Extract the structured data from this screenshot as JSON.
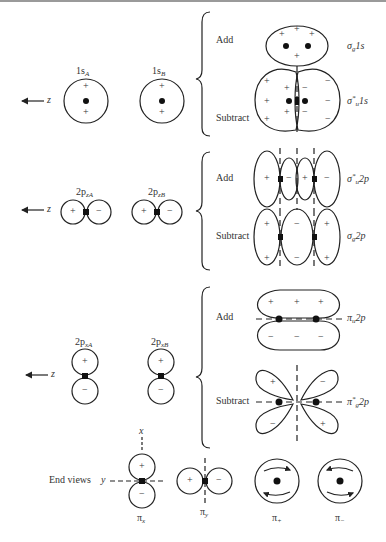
{
  "axis": {
    "z_label": "z",
    "x_label": "x",
    "y_label": "y"
  },
  "atomic_orbitals": {
    "s_A": {
      "main": "1s",
      "sub": "A"
    },
    "s_B": {
      "main": "1s",
      "sub": "B"
    },
    "pz_A": {
      "main": "2p",
      "sub": "zA"
    },
    "pz_B": {
      "main": "2p",
      "sub": "zB"
    },
    "px_A": {
      "main": "2p",
      "sub": "xA"
    },
    "px_B": {
      "main": "2p",
      "sub": "xB"
    }
  },
  "combinations": {
    "add": "Add",
    "subtract": "Subtract"
  },
  "molecular_orbitals": {
    "sigma_g_1s": {
      "sym": "σ",
      "sub": "g",
      "sup": "",
      "tail": "1s"
    },
    "sigma_u_star_1s": {
      "sym": "σ",
      "sub": "u",
      "sup": "*",
      "tail": "1s"
    },
    "sigma_u_star_2p": {
      "sym": "σ",
      "sub": "u",
      "sup": "*",
      "tail": "2p"
    },
    "sigma_g_2p": {
      "sym": "σ",
      "sub": "g",
      "sup": "",
      "tail": "2p"
    },
    "pi_u_2p": {
      "sym": "π",
      "sub": "u",
      "sup": "",
      "tail": "2p"
    },
    "pi_g_star_2p": {
      "sym": "π",
      "sub": "g",
      "sup": "*",
      "tail": "2p"
    }
  },
  "end_views": {
    "label": "End views",
    "pi_x": {
      "sym": "π",
      "sub": "x"
    },
    "pi_y": {
      "sym": "π",
      "sub": "y"
    },
    "pi_plus": {
      "sym": "π",
      "sub": "+"
    },
    "pi_minus": {
      "sym": "π",
      "sub": "−"
    }
  },
  "signs": {
    "plus": "+",
    "minus": "−"
  }
}
